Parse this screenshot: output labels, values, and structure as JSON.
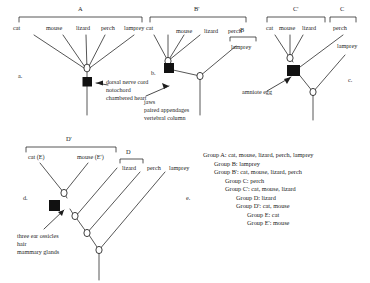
{
  "figure": {
    "panels": [
      {
        "id": "a",
        "letter": "a.",
        "group_brackets": [
          {
            "label": "A",
            "taxa": [
              "cat",
              "mouse",
              "lizard",
              "perch",
              "lamprey"
            ]
          }
        ],
        "taxa": [
          "cat",
          "mouse",
          "lizard",
          "perch",
          "lamprey"
        ],
        "annotation_lines": [
          "dorsal nerve cord",
          "notochord",
          "chambered heart"
        ]
      },
      {
        "id": "b",
        "letter": "b.",
        "group_brackets": [
          {
            "label": "B'",
            "taxa": [
              "cat",
              "mouse",
              "lizard",
              "perch"
            ]
          },
          {
            "label": "B",
            "taxa": [
              "lamprey"
            ]
          }
        ],
        "taxa": [
          "cat",
          "mouse",
          "lizard",
          "perch",
          "lamprey"
        ],
        "annotation_lines": [
          "jaws",
          "paired appendages",
          "vertebral column"
        ]
      },
      {
        "id": "c",
        "letter": "c.",
        "group_brackets": [
          {
            "label": "C'",
            "taxa": [
              "cat",
              "mouse",
              "lizard"
            ]
          },
          {
            "label": "C",
            "taxa": [
              "perch"
            ]
          }
        ],
        "taxa": [
          "cat",
          "mouse",
          "lizard",
          "perch",
          "lamprey"
        ],
        "annotation_lines": [
          "amniote egg"
        ]
      },
      {
        "id": "d",
        "letter": "d.",
        "group_brackets": [
          {
            "label": "D'",
            "taxa": [
              "cat (E)",
              "mouse (E')"
            ]
          },
          {
            "label": "D",
            "taxa": [
              "lizard"
            ]
          }
        ],
        "taxa": [
          "cat (E)",
          "mouse (E')",
          "lizard",
          "perch",
          "lamprey"
        ],
        "annotation_lines": [
          "three ear ossicles",
          "hair",
          "mammary glands"
        ]
      }
    ],
    "legend": {
      "letter": "e.",
      "lines": [
        "Group A: cat, mouse, lizard, perch, lamprey",
        "Group B: lamprey",
        "Group B': cat, mouse, lizard, perch",
        "Group C: perch",
        "Group C': cat, mouse, lizard",
        "Group D: lizard",
        "Group D': cat, mouse",
        "Group E: cat",
        "Group E': mouse"
      ]
    },
    "panel_a_labels": {
      "bracket_A": "A",
      "taxon_cat": "cat",
      "taxon_mouse": "mouse",
      "taxon_lizard": "lizard",
      "taxon_perch": "perch",
      "taxon_lamprey": "lamprey",
      "letter": "a.",
      "annot_1": "dorsal nerve cord",
      "annot_2": "notochord",
      "annot_3": "chambered heart"
    },
    "panel_b_labels": {
      "bracket_Bprime": "B'",
      "bracket_B": "B",
      "taxon_cat": "cat",
      "taxon_mouse": "mouse",
      "taxon_lizard": "lizard",
      "taxon_perch": "perch",
      "taxon_lamprey": "lamprey",
      "letter": "b.",
      "annot_1": "jaws",
      "annot_2": "paired appendages",
      "annot_3": "vertebral column"
    },
    "panel_c_labels": {
      "bracket_Cprime": "C'",
      "bracket_C": "C",
      "taxon_cat": "cat",
      "taxon_mouse": "mouse",
      "taxon_lizard": "lizard",
      "taxon_perch": "perch",
      "taxon_lamprey": "lamprey",
      "letter": "c.",
      "annot_1": "amniote egg"
    },
    "panel_d_labels": {
      "bracket_Dprime": "D'",
      "bracket_D": "D",
      "taxon_cat": "cat (E)",
      "taxon_mouse": "mouse (E')",
      "taxon_lizard": "lizard",
      "taxon_perch": "perch",
      "taxon_lamprey": "lamprey",
      "letter": "d.",
      "annot_1": "three ear ossicles",
      "annot_2": "hair",
      "annot_3": "mammary glands"
    },
    "legend_lines": {
      "l0": "Group A: cat, mouse, lizard, perch, lamprey",
      "l1": "Group B: lamprey",
      "l2": "Group B': cat, mouse, lizard, perch",
      "l3": "Group C: perch",
      "l4": "Group C': cat, mouse, lizard",
      "l5": "Group D: lizard",
      "l6": "Group D': cat, mouse",
      "l7": "Group E: cat",
      "l8": "Group E': mouse",
      "letter": "e."
    },
    "colors": {
      "line": "#1d1d1d",
      "node_fill": "#ffffff",
      "derived_node_fill": "#111111",
      "text": "#1d1d1d",
      "background": "#ffffff"
    }
  }
}
